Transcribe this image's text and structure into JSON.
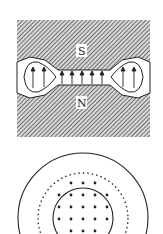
{
  "figure": {
    "top_panel": {
      "description": "Magnet pole pieces with field lines in gap",
      "pole_top_label": "S",
      "pole_bottom_label": "N",
      "gap_arrow_count": 6,
      "arrow_direction": "up"
    },
    "bottom_panel": {
      "description": "Concentric circles: outer solid, middle dotted, inner solid with dot grid",
      "dot_rows": 5,
      "dot_pattern": "grid"
    },
    "colors": {
      "ink": "#222222",
      "hatch": "#555555",
      "background": "#ffffff"
    }
  }
}
